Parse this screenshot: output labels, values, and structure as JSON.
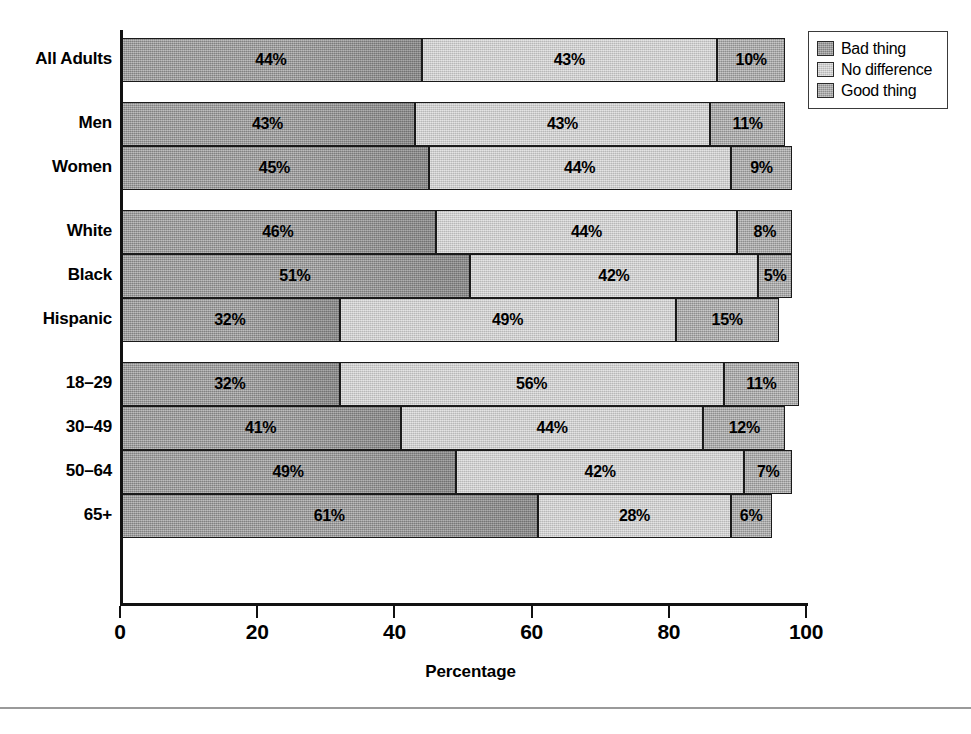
{
  "chart_data": {
    "type": "bar",
    "orientation": "horizontal",
    "stacked": true,
    "title": "",
    "xlabel": "Percentage",
    "ylabel": "",
    "xlim": [
      0,
      100
    ],
    "xticks": [
      0,
      20,
      40,
      60,
      80,
      100
    ],
    "grid": false,
    "legend_position": "top-right",
    "categories": [
      "All Adults",
      "Men",
      "Women",
      "White",
      "Black",
      "Hispanic",
      "18–29",
      "30–49",
      "50–64",
      "65+"
    ],
    "series": [
      {
        "name": "Bad thing",
        "color": "#9c9c9c",
        "values": [
          44,
          43,
          45,
          46,
          51,
          32,
          32,
          41,
          49,
          61
        ]
      },
      {
        "name": "No difference",
        "color": "#cdcdcd",
        "values": [
          43,
          43,
          44,
          44,
          42,
          49,
          56,
          44,
          42,
          28
        ]
      },
      {
        "name": "Good thing",
        "color": "#a8a8a8",
        "values": [
          10,
          11,
          9,
          8,
          5,
          15,
          11,
          12,
          7,
          6
        ]
      }
    ],
    "data_label_suffix": "%",
    "group_gaps_after": [
      "All Adults",
      "Women",
      "Hispanic"
    ]
  },
  "legend": {
    "items": [
      {
        "label": "Bad thing",
        "color": "#9c9c9c",
        "fill_class": "fill-bad"
      },
      {
        "label": "No difference",
        "color": "#cdcdcd",
        "fill_class": "fill-nodiff"
      },
      {
        "label": "Good thing",
        "color": "#a8a8a8",
        "fill_class": "fill-good"
      }
    ]
  },
  "axis": {
    "x_title": "Percentage",
    "tick_labels": [
      "0",
      "20",
      "40",
      "60",
      "80",
      "100"
    ]
  },
  "bar_labels": {
    "all_adults": [
      "44%",
      "43%",
      "10%"
    ],
    "men": [
      "43%",
      "43%",
      "11%"
    ],
    "women": [
      "45%",
      "44%",
      "9%"
    ],
    "white": [
      "46%",
      "44%",
      "8%"
    ],
    "black": [
      "51%",
      "42%",
      "5%"
    ],
    "hispanic": [
      "32%",
      "49%",
      "15%"
    ],
    "age_18_29": [
      "32%",
      "56%",
      "11%"
    ],
    "age_30_49": [
      "41%",
      "44%",
      "12%"
    ],
    "age_50_64": [
      "49%",
      "42%",
      "7%"
    ],
    "age_65_plus": [
      "61%",
      "28%",
      "6%"
    ]
  }
}
